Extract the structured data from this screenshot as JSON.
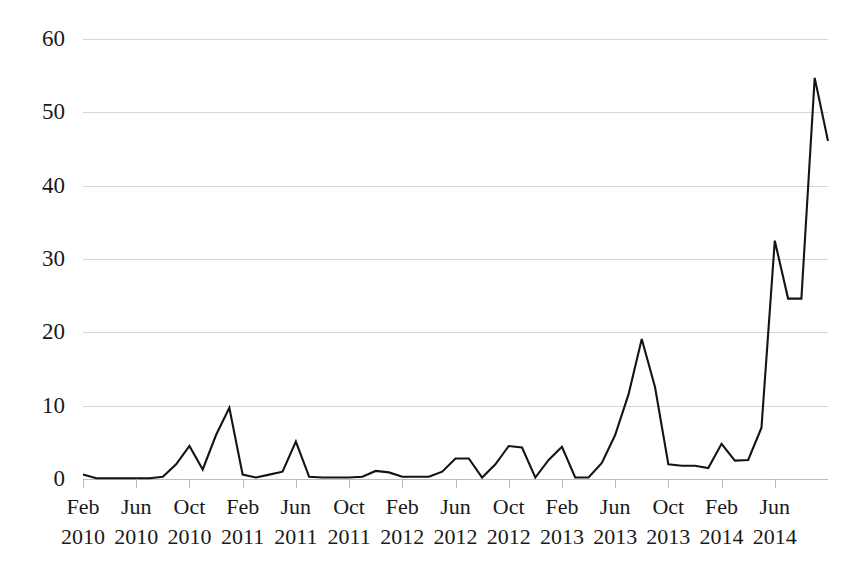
{
  "chart_data": {
    "type": "line",
    "title": "",
    "subtitle": "",
    "xlabel": "",
    "ylabel": "",
    "ylim": [
      0,
      60
    ],
    "ytick_labels": [
      "60",
      "50",
      "40",
      "30",
      "20",
      "10",
      "0"
    ],
    "ytick_values": [
      60,
      50,
      40,
      30,
      20,
      10,
      0
    ],
    "grid": true,
    "legend": false,
    "legend_position": "none",
    "series_color": "#141414",
    "grid_color": "#d6d6d6",
    "xtick_labels": [
      {
        "month": "Feb",
        "year": "2010"
      },
      {
        "month": "Jun",
        "year": "2010"
      },
      {
        "month": "Oct",
        "year": "2010"
      },
      {
        "month": "Feb",
        "year": "2011"
      },
      {
        "month": "Jun",
        "year": "2011"
      },
      {
        "month": "Oct",
        "year": "2011"
      },
      {
        "month": "Feb",
        "year": "2012"
      },
      {
        "month": "Jun",
        "year": "2012"
      },
      {
        "month": "Oct",
        "year": "2012"
      },
      {
        "month": "Feb",
        "year": "2013"
      },
      {
        "month": "Jun",
        "year": "2013"
      },
      {
        "month": "Oct",
        "year": "2013"
      },
      {
        "month": "Feb",
        "year": "2014"
      },
      {
        "month": "Jun",
        "year": "2014"
      }
    ],
    "xtick_interval_months": 4,
    "x": [
      "Feb 2010",
      "Mar 2010",
      "Apr 2010",
      "May 2010",
      "Jun 2010",
      "Jul 2010",
      "Aug 2010",
      "Sep 2010",
      "Oct 2010",
      "Nov 2010",
      "Dec 2010",
      "Jan 2011",
      "Feb 2011",
      "Mar 2011",
      "Apr 2011",
      "May 2011",
      "Jun 2011",
      "Jul 2011",
      "Aug 2011",
      "Sep 2011",
      "Oct 2011",
      "Nov 2011",
      "Dec 2011",
      "Jan 2012",
      "Feb 2012",
      "Mar 2012",
      "Apr 2012",
      "May 2012",
      "Jun 2012",
      "Jul 2012",
      "Aug 2012",
      "Sep 2012",
      "Oct 2012",
      "Nov 2012",
      "Dec 2012",
      "Jan 2013",
      "Feb 2013",
      "Mar 2013",
      "Apr 2013",
      "May 2013",
      "Jun 2013",
      "Jul 2013",
      "Aug 2013",
      "Sep 2013",
      "Oct 2013",
      "Nov 2013",
      "Dec 2013",
      "Jan 2014",
      "Feb 2014",
      "Mar 2014",
      "Apr 2014",
      "May 2014",
      "Jun 2014",
      "Jul 2014",
      "Aug 2014",
      "Sep 2014",
      "Oct 2014"
    ],
    "values": [
      0.6,
      0.1,
      0.1,
      0.1,
      0.1,
      0.1,
      0.3,
      2.0,
      4.5,
      1.3,
      6.0,
      9.7,
      0.6,
      0.2,
      0.6,
      1.0,
      5.1,
      0.3,
      0.2,
      0.2,
      0.2,
      0.3,
      1.1,
      0.9,
      0.3,
      0.3,
      0.3,
      1.0,
      2.8,
      2.8,
      0.2,
      2.0,
      4.5,
      4.3,
      0.2,
      2.6,
      4.4,
      0.2,
      0.2,
      2.2,
      6.0,
      11.5,
      19.1,
      12.5,
      2.0,
      1.8,
      1.8,
      1.5,
      4.8,
      2.5,
      2.6,
      7.0,
      32.5,
      24.6,
      24.6,
      54.7,
      46.1
    ],
    "series_name": "",
    "n_points": 57
  }
}
